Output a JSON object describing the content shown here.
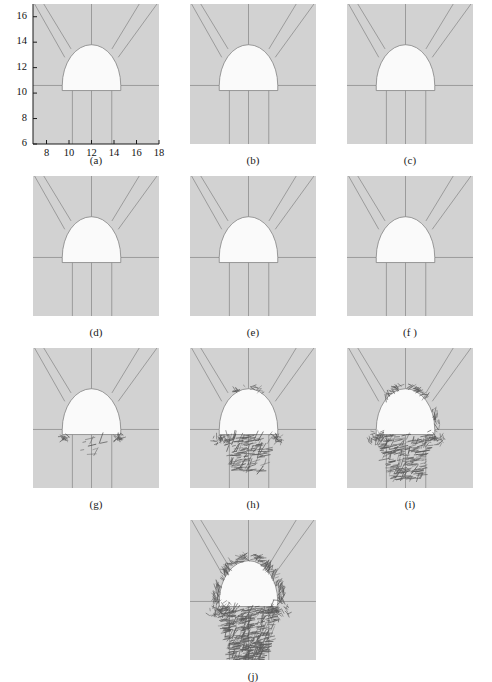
{
  "figure": {
    "type": "multi-panel-scientific-figure",
    "panel_count": 10,
    "background_color": "#d2d2d2",
    "excavation_fill_color": "#fafafa",
    "line_color": "#6f6f6f",
    "crack_color": "#4a4a4a",
    "page_background": "#ffffff"
  },
  "axes": {
    "shown_on_panel": "(a)",
    "x_ticks": [
      "8",
      "10",
      "12",
      "14",
      "16",
      "18"
    ],
    "y_ticks": [
      "6",
      "8",
      "10",
      "12",
      "14",
      "16"
    ],
    "xlim": [
      6.8,
      18.0
    ],
    "ylim": [
      6.0,
      17.0
    ],
    "xlabel": "",
    "ylabel": "",
    "grid": false
  },
  "panels": [
    {
      "id": "a",
      "caption": "(a)",
      "stage": 1,
      "cracks": "none"
    },
    {
      "id": "b",
      "caption": "(b)",
      "stage": 2,
      "cracks": "none"
    },
    {
      "id": "c",
      "caption": "(c)",
      "stage": 3,
      "cracks": "none"
    },
    {
      "id": "d",
      "caption": "(d)",
      "stage": 4,
      "cracks": "none"
    },
    {
      "id": "e",
      "caption": "(e)",
      "stage": 5,
      "cracks": "none"
    },
    {
      "id": "f",
      "caption": "(f )",
      "stage": 6,
      "cracks": "none"
    },
    {
      "id": "g",
      "caption": "(g)",
      "stage": 7,
      "cracks": "incipient-floor-corners"
    },
    {
      "id": "h",
      "caption": "(h)",
      "stage": 8,
      "cracks": "floor-hatched-wedge"
    },
    {
      "id": "i",
      "caption": "(i)",
      "stage": 9,
      "cracks": "floor-wedge-plus-shoulders"
    },
    {
      "id": "j",
      "caption": "(j)",
      "stage": 10,
      "cracks": "full-perimeter-and-deep-floor"
    }
  ],
  "chart_data": {
    "type": "scatter",
    "title": "",
    "xlabel": "",
    "ylabel": "",
    "xlim": [
      6.8,
      18.0
    ],
    "ylim": [
      6.0,
      17.0
    ],
    "grid": false,
    "legend": "none",
    "tick_labels": {
      "x": [
        8,
        10,
        12,
        14,
        16,
        18
      ],
      "y": [
        6,
        8,
        10,
        12,
        14,
        16
      ]
    },
    "tunnel_geometry": {
      "shape": "horseshoe",
      "springline_y": 10.6,
      "floor_y": 10.2,
      "crown_top_y": 13.8,
      "left_wall_x": 9.4,
      "right_wall_x": 14.6,
      "center_x": 12.0,
      "arch_radius": 2.6
    },
    "mesh_lines": {
      "radial_diagonals": 4,
      "horizontal_springline": 1,
      "vertical_below_floor": 3,
      "vertical_below_floor_x": [
        10.3,
        12.0,
        13.8
      ]
    },
    "series": [
      {
        "name": "(a) stage 1 — intact",
        "crack_density": 0.0
      },
      {
        "name": "(b) stage 2 — intact",
        "crack_density": 0.0
      },
      {
        "name": "(c) stage 3 — intact",
        "crack_density": 0.0
      },
      {
        "name": "(d) stage 4 — intact",
        "crack_density": 0.0
      },
      {
        "name": "(e) stage 5 — intact",
        "crack_density": 0.0
      },
      {
        "name": "(f ) stage 6 — intact",
        "crack_density": 0.0
      },
      {
        "name": "(g) stage 7 — incipient cracking",
        "crack_density": 0.08
      },
      {
        "name": "(h) stage 8 — floor shear wedge",
        "crack_density": 0.35
      },
      {
        "name": "(i) stage 9 — wedge + shoulders",
        "crack_density": 0.55
      },
      {
        "name": "(j) stage 10 — full failure zone",
        "crack_density": 1.0
      }
    ]
  }
}
